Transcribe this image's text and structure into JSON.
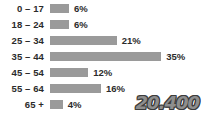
{
  "chart_data": {
    "type": "bar",
    "orientation": "horizontal",
    "title": "",
    "xlabel": "",
    "ylabel": "",
    "grid": false,
    "legend": null,
    "xlim": [
      0,
      40
    ],
    "categories": [
      "0 – 17",
      "18 – 24",
      "25 – 34",
      "35 – 44",
      "45 – 54",
      "55 – 64",
      "65 +"
    ],
    "values": [
      6,
      6,
      21,
      35,
      12,
      16,
      4
    ],
    "value_labels": [
      "6%",
      "6%",
      "21%",
      "35%",
      "12%",
      "16%",
      "4%"
    ],
    "bar_color": "#9a9a9a",
    "text_color": "#2b2b2b",
    "background": "#ffffff",
    "annotations": [
      {
        "name": "total-figure",
        "text": "20.400",
        "position": "bottom-right",
        "fill_color": "#8e8e8e",
        "outline_color": "#3d3d3d"
      }
    ]
  }
}
